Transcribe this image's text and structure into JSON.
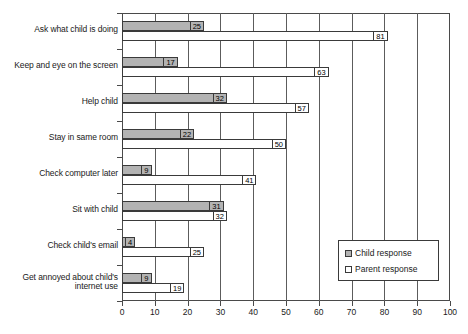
{
  "chart_data": {
    "type": "bar",
    "orientation": "horizontal",
    "title": "",
    "xlabel": "",
    "ylabel": "",
    "xlim": [
      0,
      100
    ],
    "xticks": [
      0,
      10,
      20,
      30,
      40,
      50,
      60,
      70,
      80,
      90,
      100
    ],
    "grid": true,
    "legend_position": "bottom-right",
    "categories": [
      "Ask what child is doing",
      "Keep and eye on the screen",
      "Help child",
      "Stay in same room",
      "Check computer later",
      "Sit with child",
      "Check child's email",
      "Get annoyed about child's internet use"
    ],
    "series": [
      {
        "name": "Child response",
        "color": "#b3b3b3",
        "values": [
          25,
          17,
          32,
          22,
          9,
          31,
          4,
          9
        ]
      },
      {
        "name": "Parent response",
        "color": "#ffffff",
        "values": [
          81,
          63,
          57,
          50,
          41,
          32,
          25,
          19
        ]
      }
    ]
  },
  "legend": {
    "items": [
      {
        "label": "Child response",
        "swatch": "child"
      },
      {
        "label": "Parent response",
        "swatch": "parent"
      }
    ]
  }
}
